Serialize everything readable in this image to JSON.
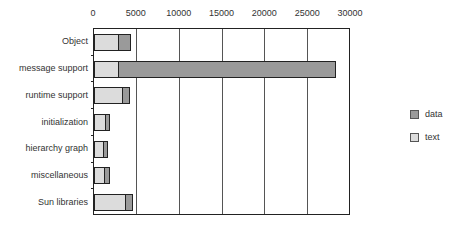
{
  "chart_data": {
    "type": "bar",
    "orientation": "horizontal",
    "stacked": true,
    "title": "",
    "xlabel": "",
    "ylabel": "",
    "xlim": [
      0,
      30000
    ],
    "x_ticks": [
      "0",
      "5000",
      "10000",
      "15000",
      "20000",
      "25000",
      "30000"
    ],
    "x_tick_values": [
      0,
      5000,
      10000,
      15000,
      20000,
      25000,
      30000
    ],
    "grid": "vertical",
    "legend_position": "right",
    "categories": [
      "Object",
      "message support",
      "runtime support",
      "initialization",
      "hierarchy graph",
      "miscellaneous",
      "Sun libraries"
    ],
    "series": [
      {
        "name": "text",
        "color": "#dcdcdc",
        "values": [
          2800,
          2800,
          3270,
          1280,
          1050,
          1170,
          3620
        ]
      },
      {
        "name": "data",
        "color": "#9a9a9a",
        "values": [
          1400,
          25300,
          820,
          470,
          470,
          580,
          820
        ]
      }
    ]
  },
  "legend": {
    "items": [
      {
        "label": "data",
        "color": "#9a9a9a"
      },
      {
        "label": "text",
        "color": "#dcdcdc"
      }
    ]
  }
}
